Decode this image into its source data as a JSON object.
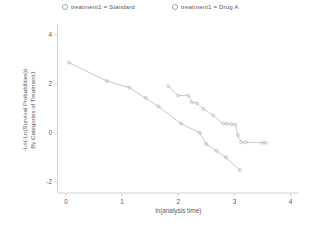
{
  "legend": {
    "position": "top",
    "entries": [
      {
        "marker": "open-circle-marker",
        "label": "treatment1 = Standard",
        "color": "#9aa7b4"
      },
      {
        "marker": "open-circle-marker",
        "label": "treatment1 = Drug A",
        "color": "#a8b4bf"
      }
    ]
  },
  "axes": {
    "xlabel": "ln(analysis time)",
    "ylabel_line1": "-Ln(-Ln(Survival Probabilities))",
    "ylabel_line2": "By Categories of Treatment1",
    "xticks": [
      "0",
      "1",
      "2",
      "3",
      "4"
    ],
    "yticks": [
      "4",
      "2",
      "0",
      "-2"
    ]
  },
  "chart_data": {
    "type": "line",
    "title": "",
    "subtitle": "",
    "xlabel": "ln(analysis time)",
    "ylabel": "-Ln(-Ln(Survival Probabilities)) By Categories of Treatment1",
    "xlim": [
      -0.15,
      4.15
    ],
    "ylim": [
      -2.45,
      4.45
    ],
    "xticks": [
      0,
      1,
      2,
      3,
      4
    ],
    "yticks": [
      4,
      2,
      0,
      -2
    ],
    "grid": false,
    "legend_position": "top",
    "series": [
      {
        "name": "treatment1 = Standard",
        "color": "#9aa7b4",
        "marker": "open-circle",
        "points": [
          {
            "x": 0.05,
            "y": 2.88
          },
          {
            "x": 0.73,
            "y": 2.12
          },
          {
            "x": 1.13,
            "y": 1.85
          },
          {
            "x": 1.42,
            "y": 1.43
          },
          {
            "x": 1.65,
            "y": 1.08
          },
          {
            "x": 2.05,
            "y": 0.38
          },
          {
            "x": 2.38,
            "y": 0.01
          },
          {
            "x": 2.5,
            "y": -0.45
          },
          {
            "x": 2.68,
            "y": -0.73
          },
          {
            "x": 2.85,
            "y": -1.0
          },
          {
            "x": 3.1,
            "y": -1.52
          }
        ]
      },
      {
        "name": "treatment1 = Drug A",
        "color": "#a8b4bf",
        "marker": "open-circle",
        "points": [
          {
            "x": 1.82,
            "y": 1.92
          },
          {
            "x": 2.0,
            "y": 1.53
          },
          {
            "x": 2.18,
            "y": 1.53
          },
          {
            "x": 2.24,
            "y": 1.25
          },
          {
            "x": 2.33,
            "y": 1.22
          },
          {
            "x": 2.45,
            "y": 0.98
          },
          {
            "x": 2.62,
            "y": 0.72
          },
          {
            "x": 2.8,
            "y": 0.38
          },
          {
            "x": 2.87,
            "y": 0.38
          },
          {
            "x": 2.95,
            "y": 0.36
          },
          {
            "x": 3.02,
            "y": 0.34
          },
          {
            "x": 3.06,
            "y": -0.08
          },
          {
            "x": 3.12,
            "y": -0.38
          },
          {
            "x": 3.2,
            "y": -0.38
          },
          {
            "x": 3.5,
            "y": -0.4
          },
          {
            "x": 3.56,
            "y": -0.4
          }
        ]
      }
    ]
  }
}
